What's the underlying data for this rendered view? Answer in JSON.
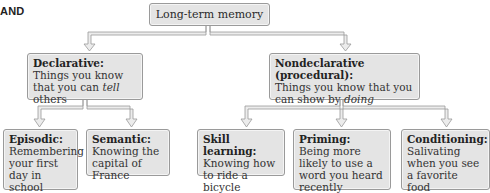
{
  "corner_label": "AND",
  "diagram": {
    "root": {
      "label": "Long-term memory"
    },
    "branches": [
      {
        "title": "Declarative:",
        "desc_before": "Things you know that you can ",
        "desc_emph": "tell",
        "desc_after": " others",
        "children": [
          {
            "title": "Episodic:",
            "desc": "Remembering your first day in school"
          },
          {
            "title": "Semantic:",
            "desc": "Knowing the capital of France"
          }
        ]
      },
      {
        "title": "Nondeclarative (procedural):",
        "desc_before": "Things you know that you can show by ",
        "desc_emph": "doing",
        "desc_after": "",
        "children": [
          {
            "title": "Skill learning:",
            "desc": "Knowing how to ride a bicycle"
          },
          {
            "title": "Priming:",
            "desc": "Being more likely to use a word you heard recently"
          },
          {
            "title": "Conditioning:",
            "desc": "Salivating when you see a favorite food"
          }
        ]
      }
    ]
  },
  "colors": {
    "box_fill": "#e4e4e4",
    "box_border": "#9a9a9a",
    "connector_fill": "#e8e8e8",
    "connector_stroke": "#9a9a9a"
  }
}
